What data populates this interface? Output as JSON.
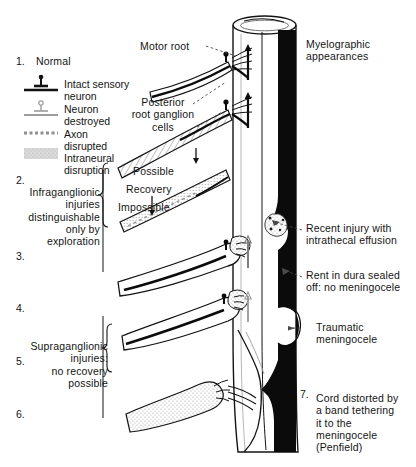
{
  "figure": {
    "title_right": "Myelographic\nappearances",
    "kind": "anatomical-diagram"
  },
  "numbered_items": [
    {
      "number": "1.",
      "label": "Normal"
    },
    {
      "number": "2.",
      "label": ""
    },
    {
      "number": "3.",
      "label": ""
    },
    {
      "number": "4.",
      "label": ""
    },
    {
      "number": "5.",
      "label": ""
    },
    {
      "number": "6.",
      "label": ""
    },
    {
      "number": "7.",
      "label": ""
    }
  ],
  "legend": {
    "items": [
      {
        "symbol": "intact-sensory-neuron",
        "label": "Intact sensory\nneuron"
      },
      {
        "symbol": "neuron-destroyed",
        "label": "Neuron\ndestroyed"
      },
      {
        "symbol": "axon-disrupted",
        "label": "Axon\ndisrupted"
      },
      {
        "symbol": "intraneural-disruption",
        "label": "Intraneural\ndisruption"
      }
    ]
  },
  "left_annotations": {
    "infraganglionic": "Infraganglionic\ninjuries\ndistinguishable\nonly by\nexploration",
    "supraganglionic": "Supraganglionic\ninjuries:\nno recovery\npossible"
  },
  "center_annotations": {
    "motor_root": "Motor root",
    "posterior_root_ganglion": "Posterior\nroot ganglion\ncells",
    "possible": "Possible",
    "recovery": "Recovery",
    "impossible": "Impossible"
  },
  "right_annotations": {
    "myelographic": "Myelographic\nappearances",
    "recent_injury": "Recent injury with\nintrathecal effusion",
    "rent_in_dura": "Rent in dura sealed\noff: no meningocele",
    "traumatic_meningocele": "Traumatic\nmeningocele",
    "cord_distorted": "Cord distorted by\na band tethering\nit to the\nmeningocele\n(Penfield)"
  },
  "colors": {
    "ink": "#141414",
    "paper": "#ffffff",
    "contrast_black": "#0b0b0b",
    "stipple_gray": "#b9b9b9",
    "line_gray": "#8d8d8d"
  }
}
